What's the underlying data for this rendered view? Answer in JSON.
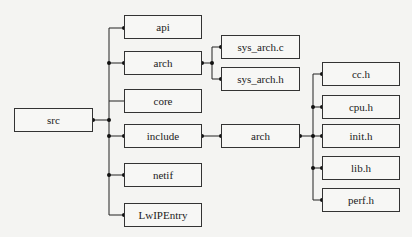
{
  "diagram": {
    "root": "src",
    "level1": [
      "api",
      "arch",
      "core",
      "include",
      "netif",
      "LwIPEntry"
    ],
    "arch_children": [
      "sys_arch.c",
      "sys_arch.h"
    ],
    "include_children": [
      "arch"
    ],
    "include_arch_children": [
      "cc.h",
      "cpu.h",
      "init.h",
      "lib.h",
      "perf.h"
    ]
  }
}
